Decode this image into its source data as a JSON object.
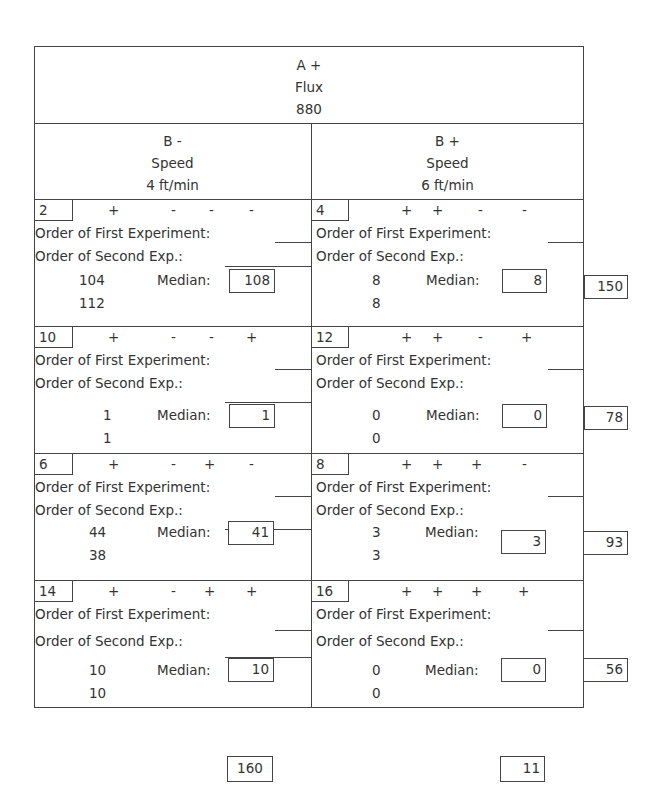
{
  "header": {
    "factor_a": "A +",
    "factor_a_name": "Flux",
    "factor_a_value": "880"
  },
  "columns": [
    {
      "factor_b": "B -",
      "name": "Speed",
      "value": "4 ft/min"
    },
    {
      "factor_b": "B +",
      "name": "Speed",
      "value": "6 ft/min"
    }
  ],
  "labels": {
    "first_exp": "Order of First Experiment:",
    "second_exp": "Order of Second Exp.:",
    "median_left": "Median:",
    "median_right": "Median:"
  },
  "rows": [
    {
      "row_total": "150",
      "cells": [
        {
          "run": "2",
          "signs": [
            "+",
            "-",
            "-",
            "-"
          ],
          "v1": "104",
          "v2": "112",
          "median": "108"
        },
        {
          "run": "4",
          "signs": [
            "+",
            "+",
            "-",
            "-"
          ],
          "v1": "8",
          "v2": "8",
          "median": "8"
        }
      ]
    },
    {
      "row_total": "78",
      "cells": [
        {
          "run": "10",
          "signs": [
            "+",
            "-",
            "-",
            "+"
          ],
          "v1": "1",
          "v2": "1",
          "median": "1"
        },
        {
          "run": "12",
          "signs": [
            "+",
            "+",
            "-",
            "+"
          ],
          "v1": "0",
          "v2": "0",
          "median": "0"
        }
      ]
    },
    {
      "row_total": "93",
      "cells": [
        {
          "run": "6",
          "signs": [
            "+",
            "-",
            "+",
            "-"
          ],
          "v1": "44",
          "v2": "38",
          "median": "41"
        },
        {
          "run": "8",
          "signs": [
            "+",
            "+",
            "+",
            "-"
          ],
          "v1": "3",
          "v2": "3",
          "median": "3"
        }
      ]
    },
    {
      "row_total": "56",
      "cells": [
        {
          "run": "14",
          "signs": [
            "+",
            "-",
            "+",
            "+"
          ],
          "v1": "10",
          "v2": "10",
          "median": "10"
        },
        {
          "run": "16",
          "signs": [
            "+",
            "+",
            "+",
            "+"
          ],
          "v1": "0",
          "v2": "0",
          "median": "0"
        }
      ]
    }
  ],
  "column_totals": [
    "160",
    "11"
  ]
}
